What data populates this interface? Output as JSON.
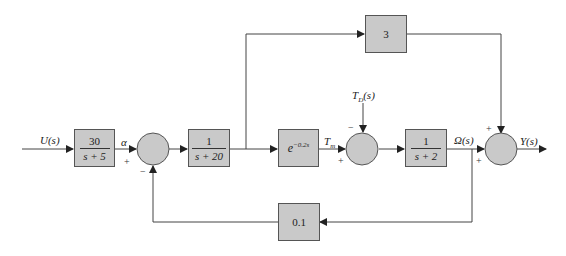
{
  "diagram": {
    "type": "control-system block diagram",
    "signals": {
      "input": "U(s)",
      "alpha": "α",
      "tm": "T",
      "tm_sub": "m",
      "disturbance": "T",
      "disturbance_sub": "D",
      "disturbance_arg": "(s)",
      "omega": "Ω(s)",
      "output": "Y(s)"
    },
    "blocks": {
      "g1": {
        "num": "30",
        "den": "s + 5"
      },
      "g2": {
        "num": "1",
        "den": "s + 20"
      },
      "delay": {
        "base": "e",
        "exponent": "−0.2s"
      },
      "g3": {
        "num": "1",
        "den": "s + 2"
      },
      "feedforward": {
        "label": "3"
      },
      "feedback": {
        "label": "0.1"
      }
    },
    "summing_junctions": {
      "sum1": {
        "top_sign": "+",
        "bottom_sign": "−"
      },
      "sum2": {
        "top_sign": "−",
        "bottom_sign": "+"
      },
      "sum3": {
        "top_sign": "+",
        "bottom_sign": "+"
      }
    },
    "colors": {
      "block_fill": "#c9c9c9",
      "line": "#444444"
    }
  }
}
